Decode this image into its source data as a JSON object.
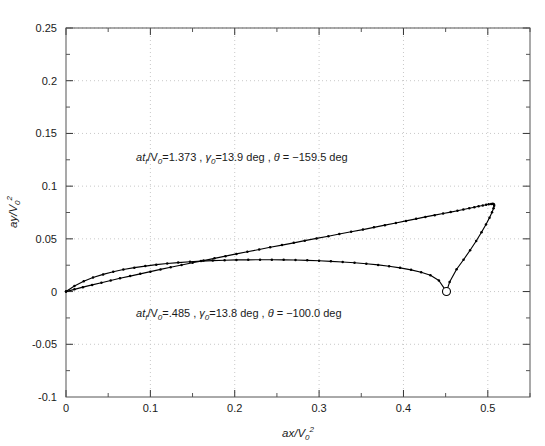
{
  "chart_data": {
    "type": "line",
    "title": "",
    "subtitle": "",
    "xlabel": "ax/V0^2",
    "ylabel": "ay/V0^2",
    "xlim": [
      0,
      0.55
    ],
    "ylim": [
      -0.1,
      0.25
    ],
    "xticks": [
      "0",
      "0.1",
      "0.2",
      "0.3",
      "0.4",
      "0.5"
    ],
    "xtick_values": [
      0,
      0.1,
      0.2,
      0.3,
      0.4,
      0.5
    ],
    "yticks": [
      "-0.1",
      "-0.05",
      "0",
      "0.05",
      "0.1",
      "0.15",
      "0.2",
      "0.25"
    ],
    "ytick_values": [
      -0.1,
      -0.05,
      0,
      0.05,
      0.1,
      0.15,
      0.2,
      0.25
    ],
    "xminor_step": 0.05,
    "yminor_step": 0.025,
    "grid": true,
    "grid_style": "dotted",
    "grid_color": "#c8c8c8",
    "legend": "none",
    "line_color": "#000000",
    "marker": "dot",
    "series": [
      {
        "name": "upper-branch",
        "comment": "rises near-linearly from origin, flattens near ay=0.083, then turns right/down",
        "x": [
          0.0,
          0.01,
          0.02,
          0.031,
          0.042,
          0.053,
          0.064,
          0.076,
          0.088,
          0.1,
          0.112,
          0.124,
          0.137,
          0.15,
          0.163,
          0.176,
          0.189,
          0.202,
          0.215,
          0.229,
          0.242,
          0.256,
          0.27,
          0.283,
          0.297,
          0.311,
          0.324,
          0.338,
          0.352,
          0.365,
          0.378,
          0.391,
          0.403,
          0.415,
          0.426,
          0.437,
          0.447,
          0.456,
          0.464,
          0.471,
          0.478,
          0.484,
          0.489,
          0.494,
          0.498,
          0.501,
          0.504,
          0.506,
          0.5072,
          0.5075,
          0.5068,
          0.505,
          0.502,
          0.4978,
          0.4925,
          0.4862,
          0.479,
          0.4712,
          0.463,
          0.4547,
          0.451
        ],
        "y": [
          0.0,
          0.0021,
          0.0042,
          0.0063,
          0.0084,
          0.0105,
          0.0126,
          0.0147,
          0.0168,
          0.0189,
          0.021,
          0.0231,
          0.0252,
          0.0273,
          0.0294,
          0.0315,
          0.0336,
          0.0357,
          0.0378,
          0.0399,
          0.042,
          0.0441,
          0.0462,
          0.0483,
          0.0504,
          0.0525,
          0.0546,
          0.0567,
          0.0588,
          0.0609,
          0.063,
          0.0651,
          0.067,
          0.069,
          0.0708,
          0.0725,
          0.074,
          0.0754,
          0.0767,
          0.0779,
          0.079,
          0.08,
          0.0809,
          0.0817,
          0.0823,
          0.0828,
          0.0831,
          0.0832,
          0.0828,
          0.0815,
          0.079,
          0.0752,
          0.07,
          0.0636,
          0.0562,
          0.048,
          0.0392,
          0.0302,
          0.0212,
          0.009,
          0.0
        ]
      },
      {
        "name": "lower-branch",
        "comment": "arcs from origin up to ay~0.030 near ax=0.28 then descends to the end marker",
        "x": [
          0.0,
          0.01,
          0.021,
          0.032,
          0.044,
          0.056,
          0.068,
          0.081,
          0.094,
          0.107,
          0.12,
          0.133,
          0.147,
          0.16,
          0.174,
          0.188,
          0.202,
          0.216,
          0.23,
          0.244,
          0.258,
          0.272,
          0.286,
          0.3,
          0.314,
          0.328,
          0.342,
          0.356,
          0.37,
          0.383,
          0.396,
          0.409,
          0.421,
          0.432,
          0.442,
          0.451
        ],
        "y": [
          0.0,
          0.0052,
          0.0097,
          0.0133,
          0.0163,
          0.0188,
          0.0209,
          0.0227,
          0.0242,
          0.0255,
          0.0266,
          0.0275,
          0.0283,
          0.0289,
          0.0294,
          0.0297,
          0.03,
          0.0301,
          0.0302,
          0.0302,
          0.0301,
          0.0299,
          0.0296,
          0.0292,
          0.0287,
          0.0281,
          0.0273,
          0.0264,
          0.0253,
          0.024,
          0.0225,
          0.0206,
          0.0183,
          0.0155,
          0.0105,
          0.0
        ]
      }
    ],
    "markers": [
      {
        "name": "end-point-open-circle",
        "x": 0.451,
        "y": 0.0,
        "style": "open-circle"
      }
    ],
    "annotations": [
      {
        "name": "upper-annotation",
        "x": 0.083,
        "y": 0.1235,
        "parts": {
          "lead_ital": "at",
          "lead_sub": "f",
          "slash": "/V",
          "slash_sub": "0",
          "value1": "=1.373 , ",
          "gamma": "γ",
          "gamma_sub": "0",
          "value2": "=13.9 deg , ",
          "theta": "θ",
          "value3": " = −159.5 deg"
        },
        "plain": "atf/V0=1.373 , γ0=13.9 deg , θ = −159.5 deg"
      },
      {
        "name": "lower-annotation",
        "x": 0.083,
        "y": -0.0245,
        "parts": {
          "lead_ital": "at",
          "lead_sub": "f",
          "slash": "/V",
          "slash_sub": "0",
          "value1": "=.485 , ",
          "gamma": "γ",
          "gamma_sub": "0",
          "value2": "=13.8 deg , ",
          "theta": "θ",
          "value3": " = −100.0 deg"
        },
        "plain": "atf/V0=.485 , γ0=13.8 deg , θ = −100.0 deg"
      }
    ],
    "axis_titles": {
      "x_ital": "ax",
      "x_slash": "/V",
      "x_sub": "0",
      "x_sup": "2",
      "y_ital": "ay",
      "y_slash": "/V",
      "y_sub": "0",
      "y_sup": "2"
    }
  }
}
